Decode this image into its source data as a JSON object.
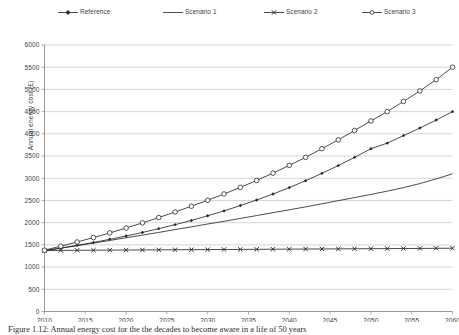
{
  "chart_data": {
    "type": "line",
    "title": "",
    "xlabel": "",
    "ylabel": "Annual energy cost (£)",
    "xlim": [
      2010,
      2060
    ],
    "ylim": [
      0,
      6000
    ],
    "ytick_step": 500,
    "xtick_step": 5,
    "grid": "horizontal",
    "legend_position": "top",
    "xticks": [
      "2010",
      "2015",
      "2020",
      "2025",
      "2030",
      "2035",
      "2040",
      "2045",
      "2050",
      "2055",
      "2060"
    ],
    "yticks": [
      "0",
      "500",
      "1000",
      "1500",
      "2000",
      "2500",
      "3000",
      "3500",
      "4000",
      "4500",
      "5000",
      "5500",
      "6000"
    ],
    "x": [
      2010,
      2012,
      2014,
      2016,
      2018,
      2020,
      2022,
      2024,
      2026,
      2028,
      2030,
      2032,
      2034,
      2036,
      2038,
      2040,
      2042,
      2044,
      2046,
      2048,
      2050,
      2052,
      2054,
      2056,
      2058,
      2060
    ],
    "series": [
      {
        "name": "Reference",
        "marker": "filled-diamond",
        "color": "#2b2b2b",
        "values": [
          1370,
          1430,
          1490,
          1555,
          1625,
          1700,
          1780,
          1865,
          1955,
          2050,
          2155,
          2265,
          2385,
          2510,
          2645,
          2790,
          2945,
          3110,
          3285,
          3470,
          3665,
          3790,
          3960,
          4130,
          4310,
          4500
        ]
      },
      {
        "name": "Scenario 1",
        "marker": "none",
        "color": "#2b2b2b",
        "values": [
          1370,
          1425,
          1480,
          1540,
          1600,
          1660,
          1720,
          1780,
          1845,
          1905,
          1970,
          2030,
          2095,
          2160,
          2225,
          2290,
          2355,
          2425,
          2495,
          2565,
          2635,
          2710,
          2790,
          2880,
          2985,
          3100
        ]
      },
      {
        "name": "Scenario 2",
        "marker": "cross",
        "color": "#2b2b2b",
        "values": [
          1370,
          1375,
          1378,
          1380,
          1382,
          1384,
          1386,
          1388,
          1390,
          1392,
          1394,
          1396,
          1398,
          1400,
          1402,
          1404,
          1406,
          1408,
          1410,
          1412,
          1414,
          1416,
          1418,
          1420,
          1422,
          1425
        ]
      },
      {
        "name": "Scenario 3",
        "marker": "open-circle",
        "color": "#2b2b2b",
        "values": [
          1380,
          1470,
          1565,
          1665,
          1770,
          1880,
          1995,
          2115,
          2240,
          2370,
          2505,
          2645,
          2795,
          2950,
          3115,
          3290,
          3470,
          3665,
          3865,
          4075,
          4290,
          4500,
          4730,
          4965,
          5220,
          5500
        ]
      }
    ]
  },
  "legend": {
    "items": [
      {
        "label": "Reference",
        "marker": "filled-diamond"
      },
      {
        "label": "Scenario 1",
        "marker": "none"
      },
      {
        "label": "Scenario 2",
        "marker": "cross"
      },
      {
        "label": "Scenario 3",
        "marker": "open-circle"
      }
    ]
  },
  "caption": {
    "text": "Figure 1.12: Annual energy cost for the the decades to become aware in a life of 50 years"
  }
}
